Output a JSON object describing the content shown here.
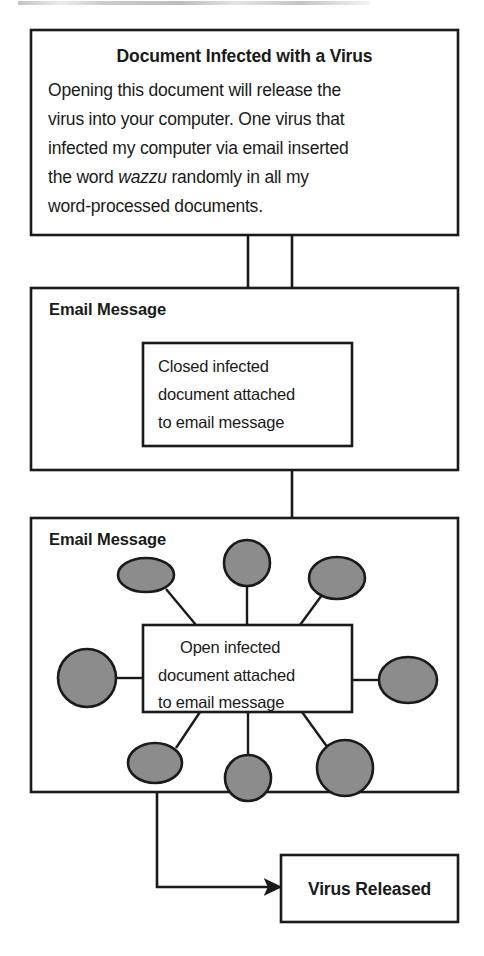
{
  "figure": {
    "kind": "flow-diagram",
    "title_visible": false,
    "background_color": "#ffffff",
    "line_color": "#1a1a1a",
    "virion_fill": "#8c8c8c"
  },
  "stage1": {
    "name": "infected-document",
    "heading": "Document Infected with a Virus",
    "body_lines": [
      "Opening this document will release the",
      "virus into your computer. One virus that",
      "infected my computer via email inserted"
    ],
    "line4_pre": "the word ",
    "line4_italic": "wazzu",
    "line4_post": " randomly in all my",
    "line5": "word-processed documents."
  },
  "stage2": {
    "name": "email-message-closed",
    "label": "Email Message",
    "inner_lines": [
      "Closed infected",
      "document attached",
      "to email message"
    ]
  },
  "stage3": {
    "name": "email-message-open",
    "label": "Email Message",
    "inner_lines": [
      "Open infected",
      "document attached",
      "to email message"
    ],
    "virions": [
      {
        "id": "virion-top-left",
        "shape": "ellipse",
        "cx": 146,
        "cy": 575,
        "rx": 28,
        "ry": 17
      },
      {
        "id": "virion-top-center",
        "shape": "circle",
        "cx": 247,
        "cy": 563,
        "rx": 23,
        "ry": 23
      },
      {
        "id": "virion-top-right",
        "shape": "ellipse",
        "cx": 337,
        "cy": 578,
        "rx": 28,
        "ry": 21
      },
      {
        "id": "virion-left",
        "shape": "circle",
        "cx": 87,
        "cy": 678,
        "rx": 29,
        "ry": 29
      },
      {
        "id": "virion-right",
        "shape": "ellipse",
        "cx": 408,
        "cy": 680,
        "rx": 29,
        "ry": 23
      },
      {
        "id": "virion-bottom-left",
        "shape": "ellipse",
        "cx": 155,
        "cy": 763,
        "rx": 27,
        "ry": 20
      },
      {
        "id": "virion-bottom-center",
        "shape": "circle",
        "cx": 248,
        "cy": 778,
        "rx": 23,
        "ry": 23
      },
      {
        "id": "virion-bottom-right",
        "shape": "circle",
        "cx": 345,
        "cy": 768,
        "rx": 28,
        "ry": 28
      }
    ]
  },
  "stage4": {
    "name": "virus-released",
    "label": "Virus Released"
  },
  "connectors": [
    {
      "id": "doc-to-closed-attachment",
      "from": "stage1",
      "to": "stage2-inner",
      "arrow": true
    },
    {
      "id": "doc-to-email-open",
      "from": "stage1",
      "to": "stage2-frame",
      "arrow": false
    },
    {
      "id": "email-closed-to-open-doc",
      "from": "stage2",
      "to": "stage3-inner",
      "arrow": true
    },
    {
      "id": "email-open-to-release",
      "from": "stage3",
      "to": "stage4",
      "arrow": true
    }
  ]
}
